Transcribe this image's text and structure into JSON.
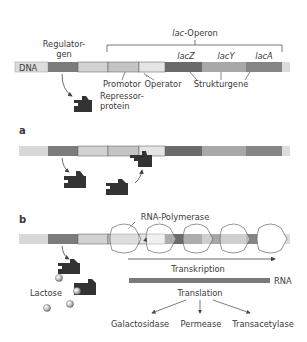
{
  "title_labels": {
    "operon": "lac-Operon",
    "operon_prefix": "lac",
    "operon_suffix": "-Operon",
    "regulator_line1": "Regulator-",
    "regulator_line2": "gen",
    "dna": "DNA",
    "promotor": "Promotor",
    "operator": "Operator",
    "strukturgene": "Strukturgene",
    "lacZ": "lacZ",
    "lacY": "lacY",
    "lacA": "lacA",
    "repressor_line1": "Repressor-",
    "repressor_line2": "protein"
  },
  "panels": {
    "a": "a",
    "b": "b"
  },
  "panel_b": {
    "rna_polymerase": "RNA-Polymerase",
    "transkription": "Transkription",
    "rna": "RNA",
    "translation": "Translation",
    "lactose": "Lactose",
    "products": [
      "Galactosidase",
      "Permease",
      "Transacetylase"
    ]
  },
  "colors": {
    "regulator_gene": "#7c7c7c",
    "spacer": "#d2d2d2",
    "promotor": "#c4c4c4",
    "operator": "#e4e4e4",
    "lacZ": "#6a6a6a",
    "lacY": "#a8a8a8",
    "lacA": "#858585",
    "repressor": "#333333",
    "dna_light": "#d8d8d8"
  }
}
